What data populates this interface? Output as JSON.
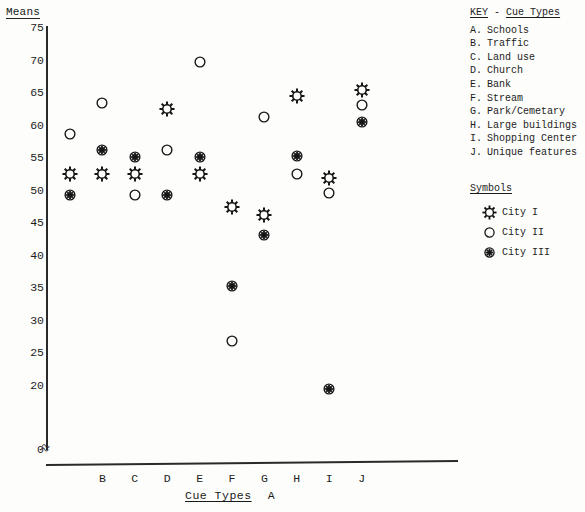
{
  "chart_data": {
    "type": "scatter",
    "title": "",
    "ylabel": "Means",
    "xlabel": "Cue Types",
    "ylim": [
      0,
      75
    ],
    "yticks": [
      75,
      70,
      65,
      60,
      55,
      50,
      45,
      40,
      35,
      30,
      25,
      20,
      0
    ],
    "categories": [
      "A",
      "B",
      "C",
      "D",
      "E",
      "F",
      "G",
      "H",
      "I",
      "J"
    ],
    "grid": false,
    "legend_position": "right",
    "axis_break": "0",
    "series": [
      {
        "name": "City I",
        "symbol": "starburst-outline",
        "values": [
          52.5,
          52.5,
          52.5,
          62.5,
          52.5,
          47.5,
          46.2,
          64.5,
          51.9,
          65.4
        ]
      },
      {
        "name": "City II",
        "symbol": "circle-outline",
        "values": [
          58.7,
          63.5,
          49.3,
          56.3,
          69.8,
          26.8,
          61.3,
          52.5,
          49.6,
          63.1
        ]
      },
      {
        "name": "City III",
        "symbol": "starburst-filled",
        "values": [
          49.3,
          56.3,
          55.2,
          49.3,
          55.2,
          35.3,
          43.2,
          55.3,
          19.4,
          60.5
        ]
      }
    ]
  },
  "key": {
    "heading_label": "KEY",
    "heading_dash": "-",
    "heading_subject": "Cue Types",
    "items": [
      {
        "letter": "A.",
        "label": "Schools"
      },
      {
        "letter": "B.",
        "label": "Traffic"
      },
      {
        "letter": "C.",
        "label": "Land use"
      },
      {
        "letter": "D.",
        "label": "Church"
      },
      {
        "letter": "E.",
        "label": "Bank"
      },
      {
        "letter": "F.",
        "label": "Stream"
      },
      {
        "letter": "G.",
        "label": "Park/Cemetary"
      },
      {
        "letter": "H.",
        "label": "Large buildings"
      },
      {
        "letter": "I.",
        "label": "Shopping Center"
      },
      {
        "letter": "J.",
        "label": "Unique features"
      }
    ]
  },
  "symbols": {
    "heading": "Symbols",
    "items": [
      {
        "name": "City I",
        "glyph": "starburst-outline"
      },
      {
        "name": "City II",
        "glyph": "circle-outline"
      },
      {
        "name": "City III",
        "glyph": "starburst-filled"
      }
    ]
  }
}
